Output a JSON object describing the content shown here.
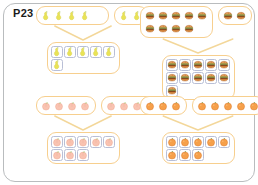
{
  "page": {
    "label": "P23",
    "border_color": "#b9bcbe",
    "background": "#ffffff"
  },
  "palette": {
    "box_orange": "#f0a33c",
    "box_soft": "#f7cf8e",
    "cell_outline": "#b9bfd6",
    "pear": "#e6e04a",
    "burger": "#d5762c",
    "peach": "#f6b9a6",
    "orange": "#f4923c"
  },
  "problems": [
    {
      "id": "pears",
      "item_name": "pear-icon",
      "item_color": "#e6e04a",
      "addend_a": 4,
      "addend_a_cols": 5,
      "addend_b": 2,
      "addend_b_cols": 2,
      "sum": 6,
      "sum_cols": 5,
      "boxed_cells": true,
      "addend_boxed": false
    },
    {
      "id": "burgers",
      "item_name": "burger-icon",
      "item_color": "#d5762c",
      "addend_a": 9,
      "addend_a_cols": 5,
      "addend_b": 2,
      "addend_b_cols": 2,
      "sum": 11,
      "sum_cols": 5,
      "boxed_cells": true,
      "addend_boxed": false
    },
    {
      "id": "peaches",
      "item_name": "peach-icon",
      "item_color": "#f6b9a6",
      "addend_a": 4,
      "addend_a_cols": 4,
      "addend_b": 4,
      "addend_b_cols": 4,
      "sum": 8,
      "sum_cols": 5,
      "boxed_cells": true,
      "addend_boxed": false
    },
    {
      "id": "oranges",
      "item_name": "orange-icon",
      "item_color": "#f4923c",
      "addend_a": 3,
      "addend_a_cols": 3,
      "addend_b": 5,
      "addend_b_cols": 5,
      "sum": 8,
      "sum_cols": 5,
      "boxed_cells": true,
      "addend_boxed": false
    }
  ],
  "chart_data": {
    "type": "table",
    "categories": [
      "pears",
      "burgers",
      "peaches",
      "oranges"
    ],
    "series": [
      {
        "name": "addend_a",
        "values": [
          4,
          9,
          4,
          3
        ]
      },
      {
        "name": "addend_b",
        "values": [
          2,
          2,
          4,
          5
        ]
      },
      {
        "name": "sum",
        "values": [
          6,
          11,
          8,
          8
        ]
      }
    ]
  }
}
